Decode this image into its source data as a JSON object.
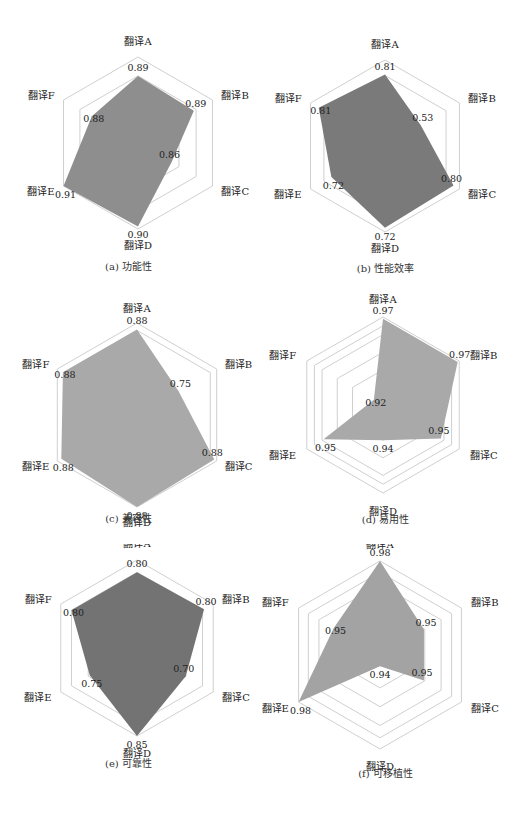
{
  "style": {
    "grid_color": "#c9c9c9",
    "fill_color_light": "#a6a6a6",
    "fill_color_mid": "#8e8e8e",
    "fill_color_dark": "#757575",
    "text_color": "#222222"
  },
  "chart_data": [
    {
      "id": "a",
      "type": "radar",
      "caption": "(a) 功能性",
      "categories": [
        "翻译A",
        "翻译B",
        "翻译C",
        "翻译D",
        "翻译E",
        "翻译F"
      ],
      "values": [
        0.89,
        0.89,
        0.86,
        0.9,
        0.91,
        0.88
      ],
      "value_labels": [
        "0.89",
        "0.89",
        "0.86",
        "0.90",
        "0.91",
        "0.88"
      ],
      "rings": 3,
      "fill": "#8e8e8e"
    },
    {
      "id": "b",
      "type": "radar",
      "caption": "(b) 性能效率",
      "categories": [
        "翻译A",
        "翻译B",
        "翻译C",
        "翻译D",
        "翻译E",
        "翻译F"
      ],
      "values": [
        0.81,
        0.53,
        0.8,
        0.72,
        0.72,
        0.81
      ],
      "value_labels": [
        "0.81",
        "0.53",
        "0.80",
        "0.72",
        "0.72",
        "0.81"
      ],
      "rings": 2,
      "fill": "#7a7a7a"
    },
    {
      "id": "c",
      "type": "radar",
      "caption": "(c) 兼容性",
      "categories": [
        "翻译A",
        "翻译B",
        "翻译C",
        "翻译D",
        "翻译E",
        "翻译F"
      ],
      "values": [
        0.88,
        0.75,
        0.88,
        0.88,
        0.88,
        0.88
      ],
      "value_labels": [
        "0.88",
        "0.75",
        "0.88",
        "0.88",
        "0.88",
        "0.88"
      ],
      "rings": 3,
      "fill": "#a9a9a9"
    },
    {
      "id": "d",
      "type": "radar",
      "caption": "(d) 易用性",
      "categories": [
        "翻译A",
        "翻译B",
        "翻译C",
        "翻译D",
        "翻译E",
        "翻译F"
      ],
      "values": [
        0.97,
        0.97,
        0.95,
        0.94,
        0.95,
        0.92
      ],
      "value_labels": [
        "0.97",
        "0.97",
        "0.95",
        "0.94",
        "0.95",
        "0.92"
      ],
      "rings": 5,
      "fill": "#a9a9a9"
    },
    {
      "id": "e",
      "type": "radar",
      "caption": "(e) 可靠性",
      "categories": [
        "翻译A",
        "翻译B",
        "翻译C",
        "翻译D",
        "翻译E",
        "翻译F"
      ],
      "values": [
        0.8,
        0.8,
        0.7,
        0.85,
        0.75,
        0.8
      ],
      "value_labels": [
        "0.80",
        "0.80",
        "0.70",
        "0.85",
        "0.75",
        "0.80"
      ],
      "rings": 3,
      "fill": "#737373"
    },
    {
      "id": "f",
      "type": "radar",
      "caption": "(f) 可移植性",
      "categories": [
        "翻译A",
        "翻译B",
        "翻译C",
        "翻译D",
        "翻译E",
        "翻译F"
      ],
      "values": [
        0.98,
        0.95,
        0.95,
        0.94,
        0.98,
        0.95
      ],
      "value_labels": [
        "0.98",
        "0.95",
        "0.95",
        "0.94",
        "0.98",
        "0.95"
      ],
      "rings": 5,
      "fill": "#a3a3a3"
    }
  ],
  "layout": [
    {
      "left": 0,
      "top": 0,
      "cx": 138,
      "cy": 143,
      "r": 86,
      "pts": [
        0.78,
        0.75,
        0.45,
        0.97,
        1.0,
        0.62
      ],
      "label_r": 1.12,
      "caption_top": 258,
      "ring_fracs": [
        0.55,
        0.78,
        1.0
      ]
    },
    {
      "left": 257,
      "top": 0,
      "cx": 128,
      "cy": 146,
      "r": 86,
      "pts": [
        0.83,
        0.48,
        0.92,
        0.95,
        0.72,
        0.89
      ],
      "label_r": 1.12,
      "caption_top": 260,
      "ring_fracs": [
        0.82,
        1.0
      ]
    },
    {
      "left": 0,
      "top": 272,
      "cx": 137,
      "cy": 143,
      "r": 92,
      "pts": [
        0.93,
        0.52,
        0.97,
        1.0,
        0.95,
        0.93
      ],
      "label_r": 1.1,
      "caption_top": 238,
      "ring_fracs": [
        0.52,
        0.92,
        1.0
      ]
    },
    {
      "left": 257,
      "top": 272,
      "cx": 126,
      "cy": 133,
      "r": 88,
      "pts": [
        0.98,
        0.98,
        0.76,
        0.4,
        0.78,
        0.12
      ],
      "label_r": 1.14,
      "caption_top": 239,
      "ring_fracs": [
        0.4,
        0.6,
        0.8,
        0.9,
        1.0
      ]
    },
    {
      "left": 0,
      "top": 544,
      "cx": 137,
      "cy": 104,
      "r": 88,
      "pts": [
        0.86,
        0.88,
        0.64,
        1.0,
        0.62,
        0.86
      ],
      "label_r": 1.12,
      "caption_top": 211,
      "ring_fracs": [
        0.64,
        0.86,
        1.0
      ]
    },
    {
      "left": 257,
      "top": 544,
      "cx": 123,
      "cy": 111,
      "r": 94,
      "pts": [
        1.0,
        0.54,
        0.54,
        0.12,
        1.0,
        0.57
      ],
      "label_r": 1.12,
      "caption_top": 221,
      "ring_fracs": [
        0.35,
        0.55,
        0.75,
        0.88,
        1.0
      ]
    }
  ]
}
